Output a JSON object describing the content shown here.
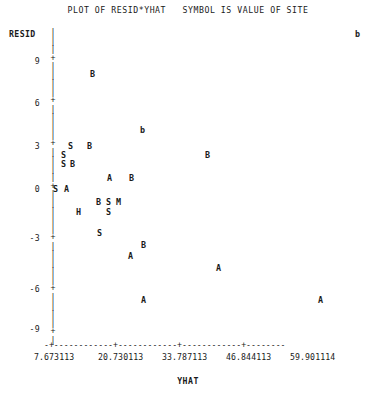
{
  "plot": {
    "title": "PLOT OF RESID*YHAT   SYMBOL IS VALUE OF SITE",
    "y_axis_label": "RESID",
    "x_axis_label": "YHAT"
  },
  "chart_data": {
    "type": "scatter",
    "title": "PLOT OF RESID*YHAT   SYMBOL IS VALUE OF SITE",
    "xlabel": "YHAT",
    "ylabel": "RESID",
    "xlim": [
      7.673113,
      66.43
    ],
    "ylim": [
      -10.2,
      10.8
    ],
    "grid": false,
    "legend": "none",
    "legend_note": "SYMBOL IS VALUE OF SITE",
    "y_ticks": [
      "9",
      "6",
      "3",
      "0",
      "-3",
      "-6",
      "-9"
    ],
    "y_tick_values": [
      9,
      6,
      3,
      0,
      -3,
      -6,
      -9
    ],
    "x_ticks": [
      "7.673113",
      "20.730113",
      "33.787113",
      "46.844113",
      "59.901114"
    ],
    "x_tick_values": [
      7.673113,
      20.730113,
      33.787113,
      46.844113,
      59.901114
    ],
    "symbols": [
      "A",
      "B",
      "b",
      "S",
      "M",
      "H"
    ],
    "points": [
      {
        "symbol": "b",
        "x": 59.5,
        "y": 10.6,
        "px": 355,
        "py": 34
      },
      {
        "symbol": "B",
        "x": 13.5,
        "y": 7.4,
        "px": 90,
        "py": 74
      },
      {
        "symbol": "b",
        "x": 22.9,
        "y": 3.9,
        "px": 140,
        "py": 130
      },
      {
        "symbol": "S",
        "x": 13.2,
        "y": 3.0,
        "px": 68,
        "py": 146
      },
      {
        "symbol": "B",
        "x": 15.1,
        "y": 3.0,
        "px": 87,
        "py": 146
      },
      {
        "symbol": "S",
        "x": 11.6,
        "y": 2.3,
        "px": 61,
        "py": 155
      },
      {
        "symbol": "B",
        "x": 37.6,
        "y": 2.3,
        "px": 205,
        "py": 155
      },
      {
        "symbol": "S",
        "x": 11.6,
        "y": 1.6,
        "px": 61,
        "py": 164
      },
      {
        "symbol": "B",
        "x": 13.2,
        "y": 1.6,
        "px": 70,
        "py": 164
      },
      {
        "symbol": "A",
        "x": 18.1,
        "y": 0.8,
        "px": 107,
        "py": 178
      },
      {
        "symbol": "B",
        "x": 20.7,
        "y": 0.8,
        "px": 129,
        "py": 178
      },
      {
        "symbol": "S",
        "x": 8.0,
        "y": 0.0,
        "px": 53,
        "py": 189
      },
      {
        "symbol": "A",
        "x": 9.5,
        "y": 0.0,
        "px": 64,
        "py": 189
      },
      {
        "symbol": "B",
        "x": 17.0,
        "y": -0.8,
        "px": 96,
        "py": 202
      },
      {
        "symbol": "S",
        "x": 18.5,
        "y": -0.8,
        "px": 106,
        "py": 202
      },
      {
        "symbol": "M",
        "x": 20.0,
        "y": -0.8,
        "px": 116,
        "py": 202
      },
      {
        "symbol": "H",
        "x": 13.6,
        "y": -1.6,
        "px": 76,
        "py": 212
      },
      {
        "symbol": "S",
        "x": 18.5,
        "y": -1.6,
        "px": 106,
        "py": 212
      },
      {
        "symbol": "S",
        "x": 17.2,
        "y": -2.6,
        "px": 97,
        "py": 233
      },
      {
        "symbol": "B",
        "x": 22.9,
        "y": -3.3,
        "px": 141,
        "py": 245
      },
      {
        "symbol": "A",
        "x": 21.2,
        "y": -3.9,
        "px": 128,
        "py": 256
      },
      {
        "symbol": "A",
        "x": 34.2,
        "y": -4.6,
        "px": 216,
        "py": 268
      },
      {
        "symbol": "A",
        "x": 22.9,
        "y": -6.4,
        "px": 141,
        "py": 300
      },
      {
        "symbol": "A",
        "x": 53.0,
        "y": -6.4,
        "px": 318,
        "py": 300
      }
    ]
  },
  "y_axis_ticks": [
    {
      "label": "9",
      "py": 60
    },
    {
      "label": "6",
      "py": 102
    },
    {
      "label": "3",
      "py": 145
    },
    {
      "label": "0",
      "py": 188
    },
    {
      "label": "-3",
      "py": 237
    },
    {
      "label": "-6",
      "py": 288
    },
    {
      "label": "-9",
      "py": 328
    }
  ],
  "x_axis_ticks": [
    {
      "label": "7.673113",
      "px": 34
    },
    {
      "label": "20.730113",
      "px": 98
    },
    {
      "label": "33.787113",
      "px": 162
    },
    {
      "label": "46.844113",
      "px": 226
    },
    {
      "label": "59.901114",
      "px": 290
    }
  ],
  "axis_glyphs": {
    "tick": "+",
    "dash": "|",
    "xline": "-+------------+------------+------------+--------"
  }
}
